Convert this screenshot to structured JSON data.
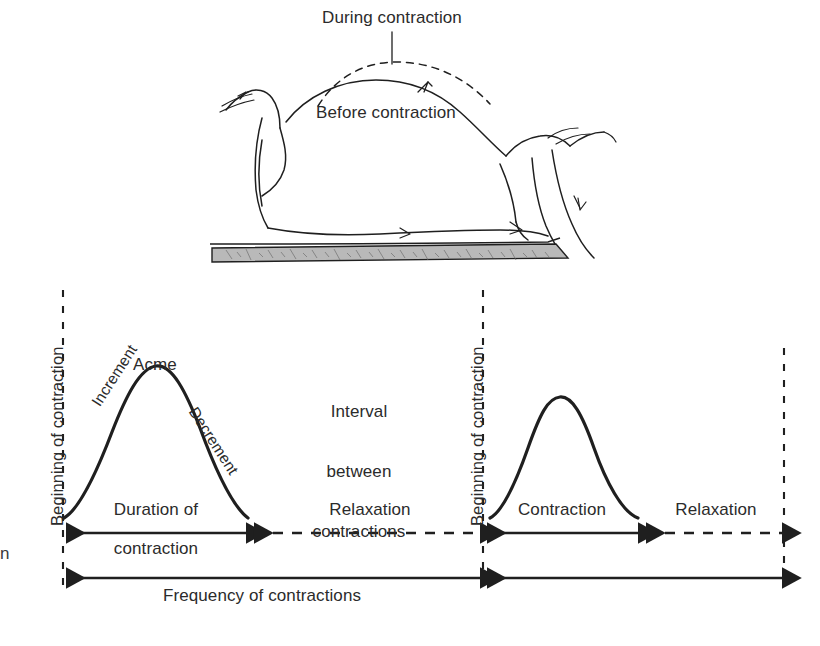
{
  "figure": {
    "title_present": false,
    "background_color": "#ffffff",
    "ink_color": "#2b2b2b",
    "line_color": "#1f1f1f",
    "bed_fill_color": "#b4b4b4"
  },
  "upper_illustration": {
    "name": "side-view-of-pregnant-abdomen",
    "labels": {
      "during_contraction": "During contraction",
      "before_contraction": "Before contraction"
    }
  },
  "lower_diagram": {
    "vertical_markers": [
      {
        "label": "Beginning of contraction"
      },
      {
        "label": "Beginning of contraction"
      },
      {
        "label": ""
      }
    ],
    "first_wave_labels": {
      "acme": "Acme",
      "increment": "Increment",
      "decrement": "Decrement"
    },
    "interval_label": "Interval\nbetween\ncontractions",
    "interval_label_lines": [
      "Interval",
      "between",
      "contractions"
    ],
    "measures": [
      {
        "name": "duration-of-contraction",
        "label": "Duration of\ncontraction",
        "lines": [
          "Duration of",
          "contraction"
        ],
        "style": "solid"
      },
      {
        "name": "relaxation-left",
        "label": "Relaxation",
        "style": "dashed"
      },
      {
        "name": "contraction-right",
        "label": "Contraction",
        "style": "solid"
      },
      {
        "name": "relaxation-right",
        "label": "Relaxation",
        "style": "dashed"
      },
      {
        "name": "frequency-of-contractions",
        "label": "Frequency of contractions",
        "style": "solid"
      }
    ]
  },
  "edge_artifact": {
    "text": "n"
  }
}
